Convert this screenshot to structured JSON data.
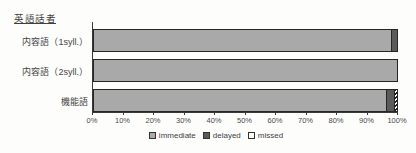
{
  "title": "英語話者",
  "chart_data": {
    "type": "bar",
    "orientation": "horizontal",
    "stacked": true,
    "title": "英語話者",
    "categories": [
      "内容語（1syll.）",
      "内容語（2syll.）",
      "機能語"
    ],
    "series": [
      {
        "name": "immediate",
        "values": [
          98,
          100,
          96.5
        ],
        "color": "#a9a9a9",
        "pattern": "solid"
      },
      {
        "name": "delayed",
        "values": [
          2,
          0,
          2.5
        ],
        "color": "#5a5a5a",
        "pattern": "solid"
      },
      {
        "name": "missed",
        "values": [
          0,
          0,
          1
        ],
        "color": "#ffffff",
        "pattern": "diagonal-hatch"
      }
    ],
    "xlim": [
      0,
      100
    ],
    "x_tick_labels": [
      "0%",
      "10%",
      "20%",
      "30%",
      "40%",
      "50%",
      "60%",
      "70%",
      "80%",
      "90%",
      "100%"
    ],
    "legend": [
      "immediate",
      "delayed",
      "missed"
    ],
    "legend_position": "bottom",
    "grid": false
  },
  "colors": {
    "immediate": "#a9a9a9",
    "delayed": "#5a5a5a",
    "missed_background": "#ffffff",
    "bar_border": "#262626",
    "axis": "#3a3a3a",
    "text": "#3b3b3b"
  }
}
